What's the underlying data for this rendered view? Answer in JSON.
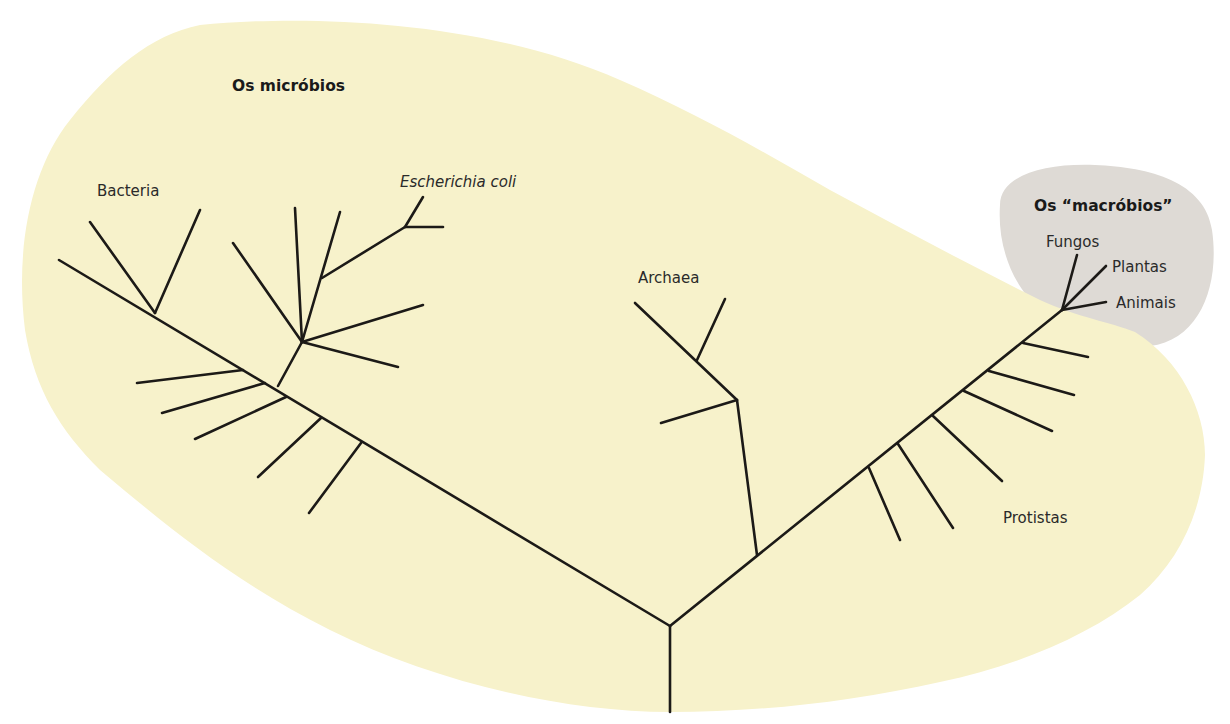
{
  "diagram": {
    "type": "phylogenetic-tree",
    "colors": {
      "microbes_region": "#F7F2CB",
      "macrobes_region": "#DEDAD5",
      "branch": "#1C1A17",
      "text": "#2A2A2A"
    },
    "regions": {
      "microbes": {
        "title": "Os micróbios"
      },
      "macrobes": {
        "title": "Os “macróbios”"
      }
    },
    "labels": {
      "bacteria": "Bacteria",
      "ecoli": "Escherichia coli",
      "archaea": "Archaea",
      "protists": "Protistas",
      "fungi": "Fungos",
      "plants": "Plantas",
      "animals": "Animais"
    }
  }
}
